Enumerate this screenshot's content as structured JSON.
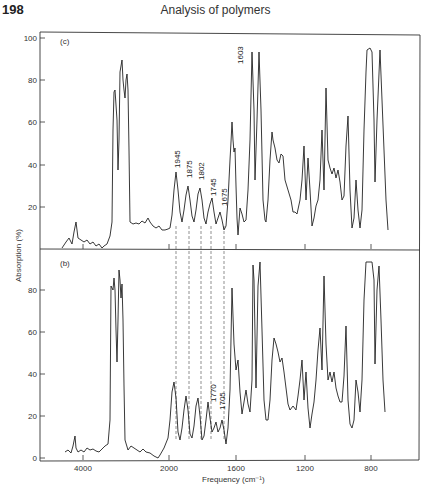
{
  "header": {
    "page_number": "198",
    "running_title": "Analysis of polymers"
  },
  "chart_data": [
    {
      "type": "line",
      "panel": "(c)",
      "title": "",
      "xlabel": "Frequency (cm⁻¹)",
      "ylabel": "Absorption (%)",
      "ylim": [
        0,
        100
      ],
      "yticks": [
        "100",
        "80",
        "60",
        "40",
        "20"
      ],
      "annotations": [
        "1945",
        "1875",
        "1802",
        "1745",
        "1675",
        "1603"
      ],
      "points_px": [
        [
          62,
          248
        ],
        [
          66,
          242
        ],
        [
          69,
          238
        ],
        [
          72,
          244
        ],
        [
          74,
          232
        ],
        [
          76,
          222
        ],
        [
          78,
          238
        ],
        [
          81,
          240
        ],
        [
          84,
          242
        ],
        [
          87,
          240
        ],
        [
          90,
          244
        ],
        [
          93,
          242
        ],
        [
          96,
          246
        ],
        [
          99,
          244
        ],
        [
          102,
          248
        ],
        [
          104,
          246
        ],
        [
          107,
          244
        ],
        [
          110,
          236
        ],
        [
          112,
          222
        ],
        [
          113,
          130
        ],
        [
          114,
          92
        ],
        [
          115,
          90
        ],
        [
          117,
          120
        ],
        [
          118,
          170
        ],
        [
          119,
          140
        ],
        [
          120,
          72
        ],
        [
          122,
          60
        ],
        [
          123,
          80
        ],
        [
          124,
          90
        ],
        [
          125,
          98
        ],
        [
          126,
          80
        ],
        [
          127,
          74
        ],
        [
          128,
          90
        ],
        [
          129,
          150
        ],
        [
          130,
          222
        ],
        [
          133,
          224
        ],
        [
          136,
          223
        ],
        [
          139,
          224
        ],
        [
          142,
          221
        ],
        [
          145,
          223
        ],
        [
          148,
          218
        ],
        [
          150,
          222
        ],
        [
          153,
          226
        ],
        [
          156,
          228
        ],
        [
          159,
          226
        ],
        [
          162,
          230
        ],
        [
          165,
          230
        ],
        [
          168,
          229
        ],
        [
          170,
          228
        ],
        [
          172,
          215
        ],
        [
          174,
          190
        ],
        [
          176,
          172
        ],
        [
          178,
          190
        ],
        [
          180,
          212
        ],
        [
          182,
          222
        ],
        [
          184,
          210
        ],
        [
          186,
          195
        ],
        [
          188,
          186
        ],
        [
          190,
          200
        ],
        [
          192,
          216
        ],
        [
          194,
          222
        ],
        [
          196,
          210
        ],
        [
          198,
          194
        ],
        [
          200,
          188
        ],
        [
          202,
          200
        ],
        [
          204,
          218
        ],
        [
          206,
          224
        ],
        [
          208,
          212
        ],
        [
          210,
          204
        ],
        [
          212,
          198
        ],
        [
          214,
          212
        ],
        [
          216,
          224
        ],
        [
          218,
          218
        ],
        [
          220,
          212
        ],
        [
          222,
          220
        ],
        [
          224,
          230
        ],
        [
          226,
          226
        ],
        [
          228,
          200
        ],
        [
          230,
          160
        ],
        [
          231,
          142
        ],
        [
          232,
          122
        ],
        [
          233,
          140
        ],
        [
          234,
          152
        ],
        [
          235,
          148
        ],
        [
          236,
          186
        ],
        [
          237,
          218
        ],
        [
          238,
          235
        ],
        [
          240,
          208
        ],
        [
          242,
          214
        ],
        [
          244,
          222
        ],
        [
          246,
          220
        ],
        [
          248,
          190
        ],
        [
          250,
          140
        ],
        [
          252,
          52
        ],
        [
          254,
          110
        ],
        [
          255,
          180
        ],
        [
          257,
          120
        ],
        [
          259,
          52
        ],
        [
          261,
          110
        ],
        [
          263,
          200
        ],
        [
          265,
          220
        ],
        [
          266,
          222
        ],
        [
          268,
          200
        ],
        [
          270,
          160
        ],
        [
          272,
          132
        ],
        [
          273,
          140
        ],
        [
          275,
          148
        ],
        [
          277,
          160
        ],
        [
          279,
          163
        ],
        [
          281,
          154
        ],
        [
          283,
          156
        ],
        [
          285,
          180
        ],
        [
          288,
          190
        ],
        [
          291,
          200
        ],
        [
          293,
          212
        ],
        [
          295,
          212
        ],
        [
          297,
          214
        ],
        [
          300,
          200
        ],
        [
          302,
          180
        ],
        [
          304,
          146
        ],
        [
          306,
          200
        ],
        [
          308,
          158
        ],
        [
          310,
          190
        ],
        [
          312,
          226
        ],
        [
          314,
          218
        ],
        [
          316,
          206
        ],
        [
          318,
          200
        ],
        [
          320,
          180
        ],
        [
          322,
          130
        ],
        [
          324,
          190
        ],
        [
          326,
          88
        ],
        [
          328,
          160
        ],
        [
          330,
          168
        ],
        [
          332,
          174
        ],
        [
          334,
          168
        ],
        [
          336,
          178
        ],
        [
          338,
          170
        ],
        [
          340,
          182
        ],
        [
          342,
          200
        ],
        [
          344,
          196
        ],
        [
          346,
          146
        ],
        [
          348,
          116
        ],
        [
          350,
          190
        ],
        [
          352,
          228
        ],
        [
          354,
          218
        ],
        [
          356,
          180
        ],
        [
          358,
          210
        ],
        [
          360,
          228
        ],
        [
          362,
          210
        ],
        [
          364,
          130
        ],
        [
          366,
          72
        ],
        [
          367,
          50
        ],
        [
          370,
          48
        ],
        [
          372,
          52
        ],
        [
          374,
          120
        ],
        [
          375,
          182
        ],
        [
          377,
          120
        ],
        [
          380,
          50
        ],
        [
          382,
          100
        ],
        [
          384,
          150
        ],
        [
          386,
          200
        ],
        [
          388,
          230
        ]
      ]
    },
    {
      "type": "line",
      "panel": "(b)",
      "title": "",
      "xlabel": "Frequency (cm⁻¹)",
      "ylabel": "Absorption (%)",
      "ylim": [
        0,
        100
      ],
      "yticks": [
        "80",
        "60",
        "40",
        "20",
        "0"
      ],
      "xticks": [
        "4000",
        "2000",
        "1600",
        "1200",
        "800"
      ],
      "annotations": [
        "1770",
        "1705"
      ],
      "points_px": [
        [
          65,
          452
        ],
        [
          68,
          450
        ],
        [
          71,
          453
        ],
        [
          73,
          446
        ],
        [
          75,
          436
        ],
        [
          76,
          448
        ],
        [
          78,
          452
        ],
        [
          81,
          450
        ],
        [
          84,
          452
        ],
        [
          87,
          448
        ],
        [
          90,
          450
        ],
        [
          93,
          449
        ],
        [
          96,
          451
        ],
        [
          99,
          452
        ],
        [
          102,
          449
        ],
        [
          105,
          446
        ],
        [
          108,
          444
        ],
        [
          110,
          420
        ],
        [
          111,
          286
        ],
        [
          113,
          290
        ],
        [
          114,
          278
        ],
        [
          115,
          290
        ],
        [
          116,
          330
        ],
        [
          117,
          362
        ],
        [
          118,
          320
        ],
        [
          119,
          270
        ],
        [
          120,
          280
        ],
        [
          121,
          298
        ],
        [
          122,
          284
        ],
        [
          123,
          320
        ],
        [
          124,
          386
        ],
        [
          125,
          440
        ],
        [
          128,
          450
        ],
        [
          131,
          446
        ],
        [
          134,
          448
        ],
        [
          137,
          450
        ],
        [
          140,
          452
        ],
        [
          143,
          449
        ],
        [
          146,
          452
        ],
        [
          150,
          453
        ],
        [
          154,
          456
        ],
        [
          158,
          458
        ],
        [
          160,
          455
        ],
        [
          164,
          448
        ],
        [
          168,
          438
        ],
        [
          170,
          420
        ],
        [
          172,
          392
        ],
        [
          174,
          382
        ],
        [
          176,
          398
        ],
        [
          178,
          432
        ],
        [
          180,
          440
        ],
        [
          182,
          428
        ],
        [
          184,
          410
        ],
        [
          186,
          396
        ],
        [
          188,
          410
        ],
        [
          190,
          434
        ],
        [
          192,
          438
        ],
        [
          194,
          426
        ],
        [
          196,
          406
        ],
        [
          198,
          398
        ],
        [
          200,
          416
        ],
        [
          202,
          440
        ],
        [
          204,
          436
        ],
        [
          206,
          420
        ],
        [
          208,
          402
        ],
        [
          210,
          418
        ],
        [
          212,
          432
        ],
        [
          214,
          428
        ],
        [
          216,
          422
        ],
        [
          218,
          432
        ],
        [
          220,
          428
        ],
        [
          222,
          420
        ],
        [
          224,
          430
        ],
        [
          226,
          444
        ],
        [
          228,
          428
        ],
        [
          230,
          390
        ],
        [
          232,
          288
        ],
        [
          234,
          344
        ],
        [
          236,
          370
        ],
        [
          238,
          360
        ],
        [
          240,
          392
        ],
        [
          242,
          414
        ],
        [
          244,
          402
        ],
        [
          246,
          390
        ],
        [
          248,
          404
        ],
        [
          250,
          412
        ],
        [
          252,
          380
        ],
        [
          253,
          265
        ],
        [
          254,
          280
        ],
        [
          256,
          388
        ],
        [
          258,
          286
        ],
        [
          260,
          262
        ],
        [
          262,
          330
        ],
        [
          264,
          400
        ],
        [
          266,
          420
        ],
        [
          268,
          420
        ],
        [
          270,
          400
        ],
        [
          272,
          360
        ],
        [
          274,
          338
        ],
        [
          276,
          344
        ],
        [
          278,
          352
        ],
        [
          280,
          362
        ],
        [
          282,
          358
        ],
        [
          284,
          372
        ],
        [
          286,
          388
        ],
        [
          288,
          404
        ],
        [
          290,
          410
        ],
        [
          293,
          406
        ],
        [
          296,
          410
        ],
        [
          298,
          396
        ],
        [
          300,
          380
        ],
        [
          302,
          360
        ],
        [
          304,
          400
        ],
        [
          306,
          372
        ],
        [
          308,
          408
        ],
        [
          310,
          428
        ],
        [
          312,
          414
        ],
        [
          314,
          402
        ],
        [
          316,
          380
        ],
        [
          318,
          350
        ],
        [
          320,
          328
        ],
        [
          322,
          370
        ],
        [
          324,
          276
        ],
        [
          326,
          344
        ],
        [
          328,
          380
        ],
        [
          330,
          372
        ],
        [
          332,
          382
        ],
        [
          334,
          372
        ],
        [
          336,
          388
        ],
        [
          338,
          396
        ],
        [
          340,
          402
        ],
        [
          342,
          402
        ],
        [
          344,
          376
        ],
        [
          346,
          326
        ],
        [
          348,
          400
        ],
        [
          350,
          424
        ],
        [
          352,
          428
        ],
        [
          354,
          420
        ],
        [
          356,
          380
        ],
        [
          358,
          392
        ],
        [
          360,
          412
        ],
        [
          362,
          380
        ],
        [
          364,
          300
        ],
        [
          366,
          262
        ],
        [
          368,
          262
        ],
        [
          372,
          262
        ],
        [
          374,
          280
        ],
        [
          375,
          364
        ],
        [
          377,
          290
        ],
        [
          379,
          266
        ],
        [
          381,
          320
        ],
        [
          383,
          380
        ],
        [
          385,
          412
        ]
      ]
    }
  ],
  "axes": {
    "y_title": "Absorption (%)",
    "x_title": "Frequency (cm⁻¹)",
    "top_panel": {
      "label": "(c)",
      "ticks": [
        {
          "label": "100",
          "y": 38
        },
        {
          "label": "80",
          "y": 80
        },
        {
          "label": "60",
          "y": 122
        },
        {
          "label": "40",
          "y": 165
        },
        {
          "label": "20",
          "y": 207
        }
      ]
    },
    "bottom_panel": {
      "label": "(b)",
      "ticks": [
        {
          "label": "80",
          "y": 290
        },
        {
          "label": "60",
          "y": 332
        },
        {
          "label": "40",
          "y": 374
        },
        {
          "label": "20",
          "y": 416
        },
        {
          "label": "0",
          "y": 458
        }
      ]
    },
    "x_ticks": [
      {
        "label": "4000",
        "x": 83
      },
      {
        "label": "2000",
        "x": 169
      },
      {
        "label": "1600",
        "x": 236
      },
      {
        "label": "1200",
        "x": 305
      },
      {
        "label": "800",
        "x": 371
      }
    ]
  },
  "annotations": {
    "top": [
      {
        "label": "1945",
        "x": 177,
        "y": 168
      },
      {
        "label": "1875",
        "x": 189,
        "y": 178
      },
      {
        "label": "1802",
        "x": 201,
        "y": 180
      },
      {
        "label": "1745",
        "x": 213,
        "y": 196
      },
      {
        "label": "1675",
        "x": 224,
        "y": 206
      },
      {
        "label": "1603",
        "x": 240,
        "y": 64
      }
    ],
    "bottom": [
      {
        "label": "1770",
        "x": 213,
        "y": 402
      },
      {
        "label": "1705",
        "x": 222,
        "y": 410
      }
    ],
    "dashed_lines_x": [
      176,
      189,
      201,
      211,
      224
    ]
  }
}
